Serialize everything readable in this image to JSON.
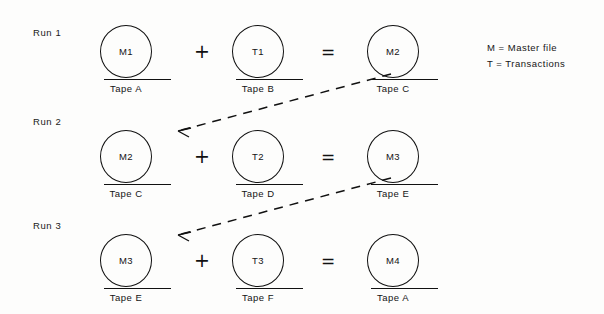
{
  "diagram": {
    "runs": [
      {
        "label": "Run 1",
        "master": {
          "reel": "M1",
          "tape": "Tape A"
        },
        "plus": "+",
        "transactions": {
          "reel": "T1",
          "tape": "Tape B"
        },
        "equals": "=",
        "result": {
          "reel": "M2",
          "tape": "Tape C"
        }
      },
      {
        "label": "Run 2",
        "master": {
          "reel": "M2",
          "tape": "Tape C"
        },
        "plus": "+",
        "transactions": {
          "reel": "T2",
          "tape": "Tape D"
        },
        "equals": "=",
        "result": {
          "reel": "M3",
          "tape": "Tape E"
        }
      },
      {
        "label": "Run 3",
        "master": {
          "reel": "M3",
          "tape": "Tape E"
        },
        "plus": "+",
        "transactions": {
          "reel": "T3",
          "tape": "Tape F"
        },
        "equals": "=",
        "result": {
          "reel": "M4",
          "tape": "Tape A"
        }
      }
    ],
    "legend": [
      {
        "symbol": "M",
        "sep": "=",
        "meaning": "Master file",
        "text": "M = Master file"
      },
      {
        "symbol": "T",
        "sep": "=",
        "meaning": "Transactions",
        "text": "T = Transactions"
      }
    ],
    "flow_arrows": [
      {
        "from": "Run 1 Tape C",
        "to": "Run 2 Tape C",
        "style": "dashed"
      },
      {
        "from": "Run 2 Tape E",
        "to": "Run 3 Tape E",
        "style": "dashed"
      }
    ],
    "colors": {
      "ink": "#111111",
      "background": "#fdfdfc"
    }
  }
}
